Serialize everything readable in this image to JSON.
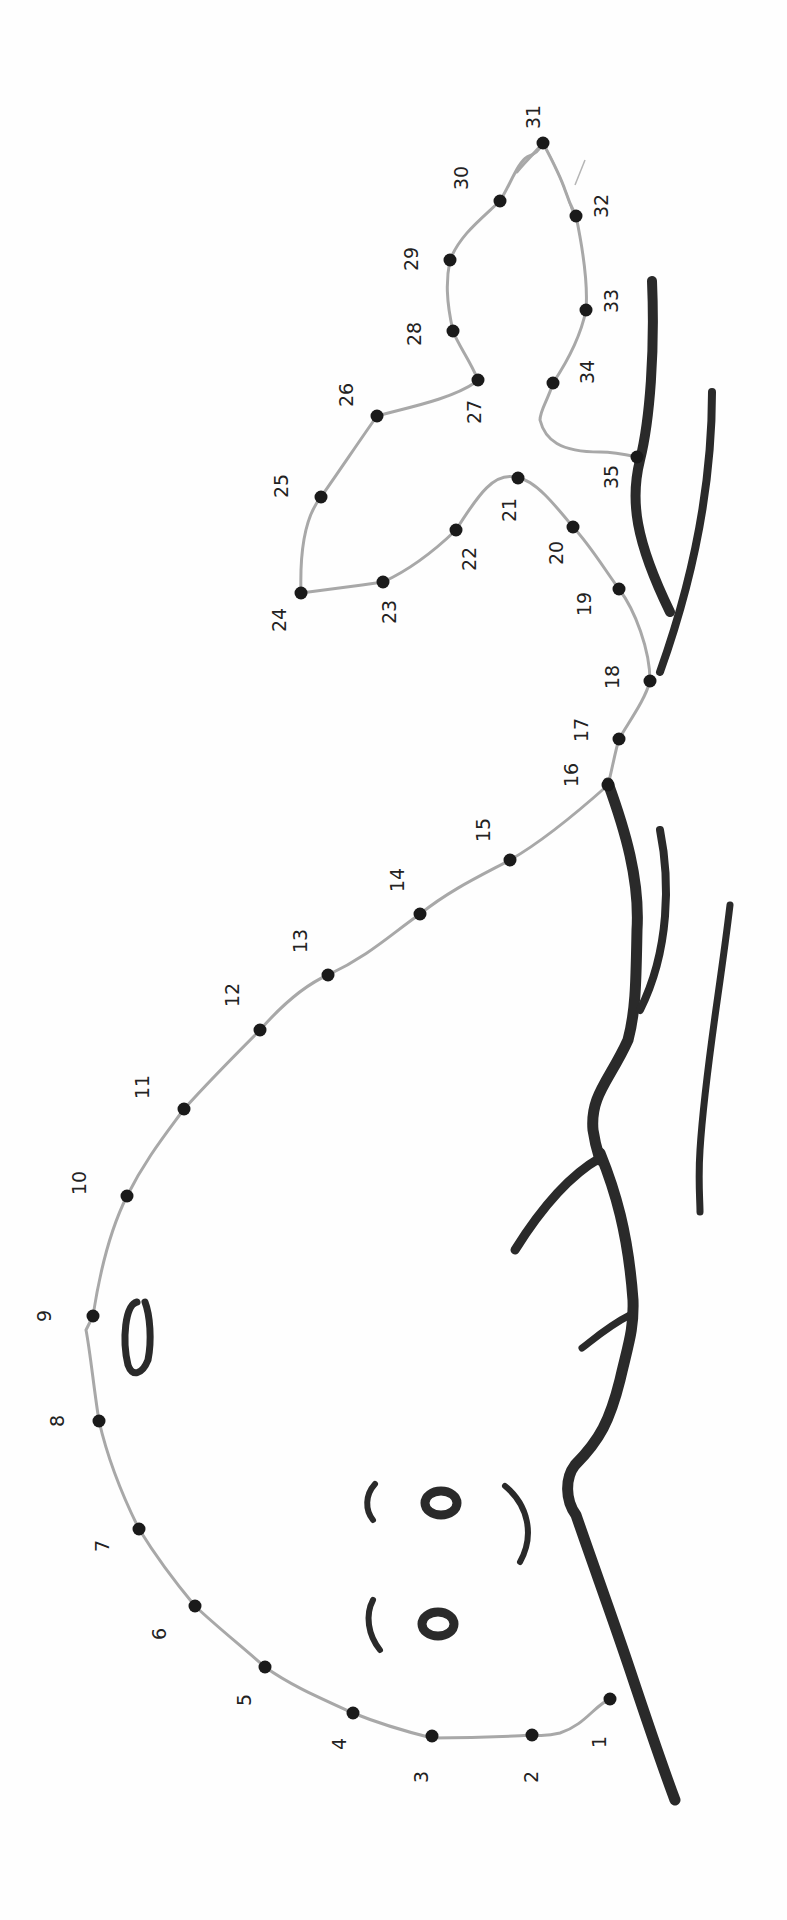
{
  "worksheet": {
    "title": "Connect the dots - whale",
    "orientation": "rotated 90deg clockwise",
    "colors": {
      "outline": "#a8a8a8",
      "ink": "#2a2a2a",
      "dot": "#1a1a1a",
      "paper": "#fefefe"
    },
    "dots": [
      {
        "n": "1",
        "x": 610,
        "y": 1699,
        "lx": 600,
        "ly": 1742
      },
      {
        "n": "2",
        "x": 532,
        "y": 1735,
        "lx": 532,
        "ly": 1777
      },
      {
        "n": "3",
        "x": 432,
        "y": 1736,
        "lx": 422,
        "ly": 1777
      },
      {
        "n": "4",
        "x": 353,
        "y": 1713,
        "lx": 340,
        "ly": 1744
      },
      {
        "n": "5",
        "x": 265,
        "y": 1667,
        "lx": 245,
        "ly": 1700
      },
      {
        "n": "6",
        "x": 195,
        "y": 1606,
        "lx": 160,
        "ly": 1634
      },
      {
        "n": "7",
        "x": 139,
        "y": 1529,
        "lx": 103,
        "ly": 1546
      },
      {
        "n": "8",
        "x": 99,
        "y": 1421,
        "lx": 58,
        "ly": 1421
      },
      {
        "n": "9",
        "x": 93,
        "y": 1316,
        "lx": 45,
        "ly": 1316
      },
      {
        "n": "10",
        "x": 127,
        "y": 1196,
        "lx": 80,
        "ly": 1183
      },
      {
        "n": "11",
        "x": 184,
        "y": 1109,
        "lx": 143,
        "ly": 1087
      },
      {
        "n": "12",
        "x": 260,
        "y": 1030,
        "lx": 233,
        "ly": 995
      },
      {
        "n": "13",
        "x": 328,
        "y": 975,
        "lx": 301,
        "ly": 941
      },
      {
        "n": "14",
        "x": 420,
        "y": 914,
        "lx": 398,
        "ly": 880
      },
      {
        "n": "15",
        "x": 510,
        "y": 860,
        "lx": 484,
        "ly": 830
      },
      {
        "n": "16",
        "x": 608,
        "y": 785,
        "lx": 572,
        "ly": 775
      },
      {
        "n": "17",
        "x": 619,
        "y": 739,
        "lx": 582,
        "ly": 730
      },
      {
        "n": "18",
        "x": 650,
        "y": 681,
        "lx": 613,
        "ly": 677
      },
      {
        "n": "19",
        "x": 619,
        "y": 589,
        "lx": 585,
        "ly": 604
      },
      {
        "n": "20",
        "x": 573,
        "y": 527,
        "lx": 557,
        "ly": 553
      },
      {
        "n": "21",
        "x": 518,
        "y": 478,
        "lx": 510,
        "ly": 510
      },
      {
        "n": "22",
        "x": 456,
        "y": 530,
        "lx": 470,
        "ly": 559
      },
      {
        "n": "23",
        "x": 383,
        "y": 582,
        "lx": 390,
        "ly": 612
      },
      {
        "n": "24",
        "x": 301,
        "y": 593,
        "lx": 280,
        "ly": 620
      },
      {
        "n": "25",
        "x": 321,
        "y": 497,
        "lx": 282,
        "ly": 486
      },
      {
        "n": "26",
        "x": 377,
        "y": 416,
        "lx": 347,
        "ly": 395
      },
      {
        "n": "27",
        "x": 478,
        "y": 380,
        "lx": 475,
        "ly": 412
      },
      {
        "n": "28",
        "x": 453,
        "y": 331,
        "lx": 415,
        "ly": 334
      },
      {
        "n": "29",
        "x": 450,
        "y": 260,
        "lx": 412,
        "ly": 259
      },
      {
        "n": "30",
        "x": 500,
        "y": 201,
        "lx": 462,
        "ly": 178
      },
      {
        "n": "31",
        "x": 543,
        "y": 143,
        "lx": 534,
        "ly": 117
      },
      {
        "n": "32",
        "x": 576,
        "y": 216,
        "lx": 602,
        "ly": 206
      },
      {
        "n": "33",
        "x": 586,
        "y": 310,
        "lx": 612,
        "ly": 301
      },
      {
        "n": "34",
        "x": 553,
        "y": 383,
        "lx": 588,
        "ly": 372
      },
      {
        "n": "35",
        "x": 637,
        "y": 457,
        "lx": 612,
        "ly": 477
      }
    ]
  }
}
